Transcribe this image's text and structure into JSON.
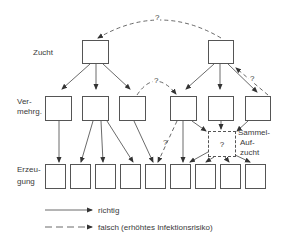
{
  "diagram": {
    "row_labels": {
      "zucht": "Zucht",
      "vermehrung_line1": "Ver-",
      "vermehrung_line2": "mehrg.",
      "erzeugung_line1": "Erzeu-",
      "erzeugung_line2": "gung"
    },
    "levels": [
      {
        "name": "Zucht",
        "box_count": 2
      },
      {
        "name": "Vermehrung",
        "box_count": 6
      },
      {
        "name": "Erzeugung",
        "box_count": 9
      }
    ],
    "sammel_aufzucht": {
      "label_line1": "Sammel-",
      "label_line2": "Auf-",
      "label_line3": "zucht",
      "inner_mark": "?"
    },
    "question_marks": {
      "top_arc": "?",
      "middle_arc": "?",
      "right_return": "?",
      "dashed_to_erzeugung": "?"
    },
    "connections": [
      {
        "from": "Zucht 1",
        "to": [
          "Vermehrung 1",
          "Vermehrung 2",
          "Vermehrung 3"
        ],
        "style": "solid"
      },
      {
        "from": "Zucht 2",
        "to": [
          "Vermehrung 4",
          "Vermehrung 5",
          "Vermehrung 6"
        ],
        "style": "solid"
      },
      {
        "from": "Zucht 2",
        "to": [
          "Zucht 1"
        ],
        "style": "dashed",
        "label": "?"
      },
      {
        "from": "Vermehrung 6",
        "to": [
          "Zucht 2"
        ],
        "style": "dashed",
        "label": "?"
      },
      {
        "from": "Vermehrung 3",
        "to": [
          "Vermehrung 4"
        ],
        "style": "dashed",
        "label": "?"
      },
      {
        "from": "Vermehrung 1",
        "to": [
          "Erzeugung 1"
        ],
        "style": "solid"
      },
      {
        "from": "Vermehrung 2",
        "to": [
          "Erzeugung 2",
          "Erzeugung 3",
          "Erzeugung 4"
        ],
        "style": "solid"
      },
      {
        "from": "Vermehrung 3",
        "to": [
          "Erzeugung 5"
        ],
        "style": "solid"
      },
      {
        "from": "Vermehrung 4",
        "to": [
          "Erzeugung 5"
        ],
        "style": "dashed",
        "label": "?"
      },
      {
        "from": "Vermehrung 4",
        "to": [
          "Erzeugung 6",
          "Sammel-Aufzucht"
        ],
        "style": "solid"
      },
      {
        "from": "Vermehrung 5",
        "to": [
          "Sammel-Aufzucht"
        ],
        "style": "solid"
      },
      {
        "from": "Vermehrung 6",
        "to": [
          "Sammel-Aufzucht"
        ],
        "style": "solid"
      },
      {
        "from": "Sammel-Aufzucht",
        "to": [
          "Erzeugung 6",
          "Erzeugung 7",
          "Erzeugung 8",
          "Erzeugung 9"
        ],
        "style": "solid"
      }
    ]
  },
  "legend": {
    "solid_label": "richtig",
    "dashed_label": "falsch (erhöhtes Infektionsrisiko)"
  }
}
